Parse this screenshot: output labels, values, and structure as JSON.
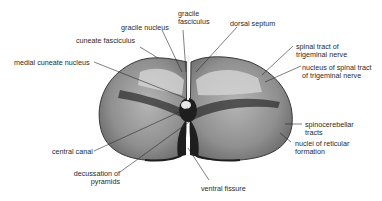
{
  "diagram": {
    "labels": {
      "gracile_fasciculus": [
        "gracile",
        "fasciculus"
      ],
      "gracile_nucleus": "gracile nucleus",
      "dorsal_septum": "dorsal septum",
      "cuneate_fasciculus": "cuneate fasciculus",
      "medial_cuneate_nucleus": "medial cuneate nucleus",
      "spinal_tract_trigeminal": [
        "spinal tract of",
        "trigeminal nerve"
      ],
      "nucleus_spinal_tract": [
        "nucleus of spinal tract",
        "of trigeminal nerve"
      ],
      "spinocerebellar_tracts": [
        "spinocerebellar",
        "tracts"
      ],
      "nuclei_reticular": [
        "nuclei of reticular",
        "formation"
      ],
      "central_canal": "central canal",
      "decussation_pyramids": [
        "decussation of",
        "pyramids"
      ],
      "ventral_fissure": "ventral fissure"
    },
    "colors": {
      "text": "#2a2a2a",
      "tissue_dark": "#1e1e1e",
      "tissue_mid": "#7a7a7a",
      "tissue_light": "#c8c8c8",
      "background": "#ffffff"
    }
  }
}
